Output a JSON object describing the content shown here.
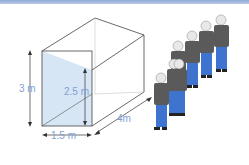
{
  "diagram": {
    "labels": {
      "height_total": "3 m",
      "height_inner": "2.5 m",
      "width": "1.5 m",
      "depth": "4m"
    },
    "people_count": 7,
    "colors": {
      "accent_text": "#7e9fd2",
      "shaded_face": "#d6e6f5",
      "jacket": "#5a5a5a",
      "trousers": "#3f73d0",
      "top_rule": "#8fa9d6"
    }
  }
}
